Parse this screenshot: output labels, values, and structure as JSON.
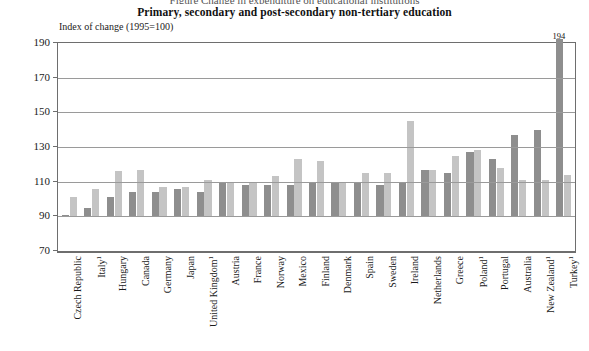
{
  "clipped_header": "Figure  Change in expenditure on educational institutions",
  "title": "Primary, secondary and post-secondary non-tertiary education",
  "axis_note": "Index of change (1995=100)",
  "chart_data": {
    "type": "bar",
    "title": "Primary, secondary and post-secondary non-tertiary education",
    "subtitle": "Index of change (1995=100)",
    "xlabel": "",
    "ylabel": "Index of change (1995=100)",
    "ylim": [
      70,
      190
    ],
    "yticks": [
      70,
      90,
      110,
      130,
      150,
      170,
      190
    ],
    "grid": true,
    "legend": "none",
    "baseline": 100,
    "categories": [
      "Czech Republic",
      "Italy¹",
      "Hungary",
      "Canada",
      "Germany",
      "Japan",
      "United Kingdom¹",
      "Austria",
      "France",
      "Norway",
      "Mexico",
      "Finland",
      "Denmark",
      "Spain",
      "Sweden",
      "Ireland",
      "Netherlands",
      "Greece",
      "Poland¹",
      "Portugal",
      "Australia",
      "New Zealand¹",
      "Turkey¹"
    ],
    "series": [
      {
        "name": "series-dark",
        "color": "#8e8e8e",
        "values": [
          90,
          95,
          101,
          104,
          104,
          106,
          104,
          109,
          108,
          108,
          108,
          110,
          109,
          109,
          108,
          110,
          117,
          115,
          127,
          123,
          137,
          140,
          194
        ]
      },
      {
        "name": "series-light",
        "color": "#c4c4c4",
        "values": [
          101,
          106,
          116,
          117,
          107,
          107,
          111,
          110,
          110,
          113,
          123,
          122,
          110,
          115,
          115,
          145,
          117,
          125,
          128,
          118,
          111,
          111,
          114
        ]
      }
    ],
    "annotations": [
      {
        "category": "Turkey¹",
        "series": "series-dark",
        "label": "194",
        "clipped_above_axis": true
      }
    ]
  }
}
